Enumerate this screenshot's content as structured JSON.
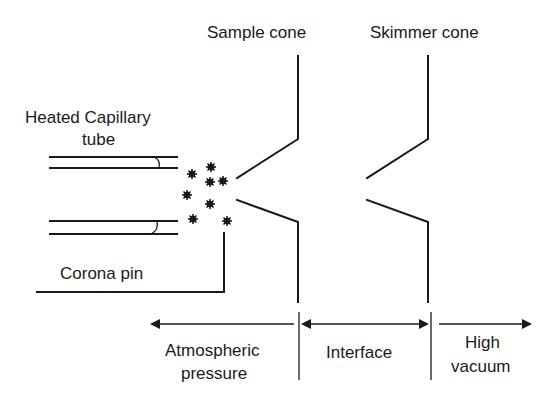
{
  "labels": {
    "sample_cone": "Sample cone",
    "skimmer_cone": "Skimmer cone",
    "capillary_line1": "Heated Capillary",
    "capillary_line2": "tube",
    "corona_pin": "Corona pin",
    "atmospheric_line1": "Atmospheric",
    "atmospheric_line2": "pressure",
    "interface": "Interface",
    "high_vacuum_line1": "High",
    "high_vacuum_line2": "vacuum"
  },
  "colors": {
    "ink": "#1a1a1a",
    "background": "#ffffff"
  }
}
